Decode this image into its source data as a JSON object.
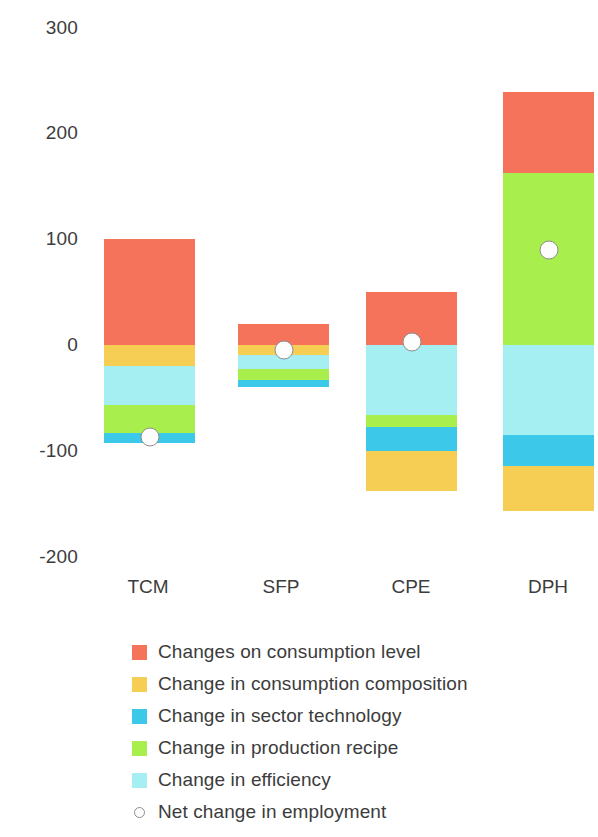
{
  "chart_data": {
    "type": "bar",
    "subtype": "stacked-waterfall-with-net-marker",
    "title": "",
    "xlabel": "",
    "ylabel": "",
    "categories": [
      "TCM",
      "SFP",
      "CPE",
      "DPH"
    ],
    "ylim": [
      -200,
      300
    ],
    "yticks": [
      300,
      200,
      100,
      0,
      -100,
      -200
    ],
    "ytick_labels": [
      "300",
      "200",
      "100",
      "0",
      "-100",
      "-200"
    ],
    "grid": false,
    "legend_position": "bottom-left",
    "series": [
      {
        "name": "Changes on consumption level",
        "color": "#F4735A",
        "values": [
          100,
          20,
          50,
          77
        ]
      },
      {
        "name": "Change in consumption composition",
        "color": "#F6CE54",
        "values": [
          -20,
          -9,
          -38,
          -42
        ]
      },
      {
        "name": "Change in sector technology",
        "color": "#3CC8E8",
        "values": [
          -10,
          -7,
          -22,
          -30
        ]
      },
      {
        "name": "Change in production recipe",
        "color": "#A8EE4D",
        "values": [
          -26,
          -10,
          -12,
          163
        ]
      },
      {
        "name": "Change in efficiency",
        "color": "#A5EFF2",
        "values": [
          -37,
          -14,
          -66,
          -85
        ]
      }
    ],
    "net_marker": {
      "name": "Net change in employment",
      "values": [
        -87,
        -5,
        3,
        90
      ],
      "fill": "#FDFDFD",
      "stroke": "#8D8D8D"
    },
    "stack_layout": [
      {
        "category": "TCM",
        "segments": [
          {
            "series": "Changes on consumption level",
            "from": 0,
            "to": 100
          },
          {
            "series": "Change in consumption composition",
            "from": -20,
            "to": 0
          },
          {
            "series": "Change in efficiency",
            "from": -57,
            "to": -20
          },
          {
            "series": "Change in production recipe",
            "from": -83,
            "to": -57
          },
          {
            "series": "Change in sector technology",
            "from": -93,
            "to": -83
          }
        ]
      },
      {
        "category": "SFP",
        "segments": [
          {
            "series": "Changes on consumption level",
            "from": 0,
            "to": 20
          },
          {
            "series": "Change in consumption composition",
            "from": -9,
            "to": 0
          },
          {
            "series": "Change in efficiency",
            "from": -23,
            "to": -9
          },
          {
            "series": "Change in production recipe",
            "from": -33,
            "to": -23
          },
          {
            "series": "Change in sector technology",
            "from": -40,
            "to": -33
          }
        ]
      },
      {
        "category": "CPE",
        "segments": [
          {
            "series": "Changes on consumption level",
            "from": 0,
            "to": 50
          },
          {
            "series": "Change in efficiency",
            "from": -66,
            "to": 0
          },
          {
            "series": "Change in production recipe",
            "from": -78,
            "to": -66
          },
          {
            "series": "Change in sector technology",
            "from": -100,
            "to": -78
          },
          {
            "series": "Change in consumption composition",
            "from": -138,
            "to": -100
          }
        ]
      },
      {
        "category": "DPH",
        "segments": [
          {
            "series": "Changes on consumption level",
            "from": 163,
            "to": 240
          },
          {
            "series": "Change in production recipe",
            "from": 0,
            "to": 163
          },
          {
            "series": "Change in efficiency",
            "from": -85,
            "to": 0
          },
          {
            "series": "Change in sector technology",
            "from": -115,
            "to": -85
          },
          {
            "series": "Change in consumption composition",
            "from": -157,
            "to": -115
          }
        ]
      }
    ]
  },
  "axis": {
    "ytick_0": "300",
    "ytick_1": "200",
    "ytick_2": "100",
    "ytick_3": "0",
    "ytick_4": "-100",
    "ytick_5": "-200",
    "xtick_0": "TCM",
    "xtick_1": "SFP",
    "xtick_2": "CPE",
    "xtick_3": "DPH"
  },
  "legend": {
    "items": [
      {
        "label": "Changes on consumption level",
        "color": "#F4735A",
        "glyph": "square-swatch"
      },
      {
        "label": "Change in consumption composition",
        "color": "#F6CE54",
        "glyph": "square-swatch"
      },
      {
        "label": "Change in sector technology",
        "color": "#3CC8E8",
        "glyph": "square-swatch"
      },
      {
        "label": "Change in production recipe",
        "color": "#A8EE4D",
        "glyph": "square-swatch"
      },
      {
        "label": "Change in efficiency",
        "color": "#A5EFF2",
        "glyph": "square-swatch"
      },
      {
        "label": "Net change in employment",
        "color": "#FDFDFD",
        "glyph": "open-circle-marker"
      }
    ]
  }
}
